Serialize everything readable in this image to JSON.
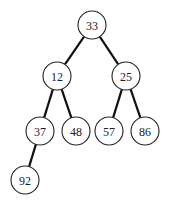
{
  "diagram": {
    "type": "binary-tree",
    "node_radius": 14,
    "nodes": [
      {
        "id": "n33",
        "label": "33",
        "x": 92,
        "y": 25
      },
      {
        "id": "n12",
        "label": "12",
        "x": 57,
        "y": 76
      },
      {
        "id": "n25",
        "label": "25",
        "x": 126,
        "y": 76
      },
      {
        "id": "n37",
        "label": "37",
        "x": 40,
        "y": 131
      },
      {
        "id": "n48",
        "label": "48",
        "x": 76,
        "y": 131
      },
      {
        "id": "n57",
        "label": "57",
        "x": 109,
        "y": 131
      },
      {
        "id": "n86",
        "label": "86",
        "x": 145,
        "y": 131
      },
      {
        "id": "n92",
        "label": "92",
        "x": 25,
        "y": 180
      }
    ],
    "edges": [
      {
        "from": "n33",
        "to": "n12"
      },
      {
        "from": "n33",
        "to": "n25"
      },
      {
        "from": "n12",
        "to": "n37"
      },
      {
        "from": "n12",
        "to": "n48"
      },
      {
        "from": "n25",
        "to": "n57"
      },
      {
        "from": "n25",
        "to": "n86"
      },
      {
        "from": "n37",
        "to": "n92"
      }
    ]
  }
}
